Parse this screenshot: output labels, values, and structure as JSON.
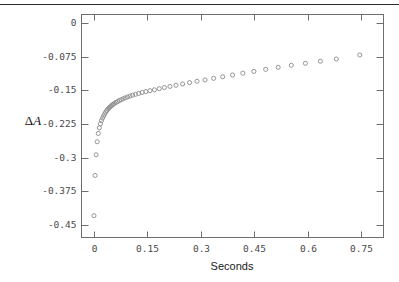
{
  "figure": {
    "top_rule": true,
    "background": "#ffffff",
    "frame_color": "#6e6e6e",
    "marker_color": "#8a8a8a",
    "text_color": "#4a4a4a"
  },
  "chart_data": {
    "type": "scatter",
    "title": "",
    "xlabel": "Seconds",
    "ylabel": "ΔA",
    "ylabel_parts": {
      "delta": "Δ",
      "variable": "A"
    },
    "xlim": [
      -0.035,
      0.812
    ],
    "ylim": [
      -0.4775,
      0.0185
    ],
    "xticks": [
      0,
      0.15,
      0.3,
      0.45,
      0.6,
      0.75
    ],
    "xticklabels": [
      "0",
      "0.15",
      "0.3",
      "0.45",
      "0.6",
      "0.75"
    ],
    "yticks": [
      0,
      -0.075,
      -0.15,
      -0.225,
      -0.3,
      -0.375,
      -0.45
    ],
    "yticklabels": [
      "0",
      "-0.075",
      "-0.15",
      "-0.225",
      "-0.3",
      "-0.375",
      "-0.45"
    ],
    "grid": false,
    "legend": null,
    "marker": "open-circle",
    "marker_size": 3.0,
    "series": [
      {
        "name": "delta-A-kinetics",
        "x": [
          0.0,
          0.003,
          0.006,
          0.009,
          0.012,
          0.015,
          0.018,
          0.021,
          0.024,
          0.027,
          0.03,
          0.033,
          0.036,
          0.039,
          0.042,
          0.045,
          0.048,
          0.051,
          0.0545,
          0.058,
          0.062,
          0.0665,
          0.071,
          0.076,
          0.0815,
          0.0875,
          0.094,
          0.101,
          0.1085,
          0.1165,
          0.1255,
          0.135,
          0.1455,
          0.157,
          0.1695,
          0.183,
          0.1975,
          0.213,
          0.23,
          0.2485,
          0.268,
          0.289,
          0.3115,
          0.3355,
          0.361,
          0.3885,
          0.4175,
          0.4485,
          0.4815,
          0.5165,
          0.5535,
          0.593,
          0.635,
          0.6795,
          0.7455
        ],
        "y": [
          -0.429,
          -0.3395,
          -0.2935,
          -0.2645,
          -0.246,
          -0.2335,
          -0.2245,
          -0.2175,
          -0.212,
          -0.207,
          -0.2025,
          -0.1985,
          -0.195,
          -0.192,
          -0.1895,
          -0.1872,
          -0.185,
          -0.183,
          -0.181,
          -0.179,
          -0.177,
          -0.175,
          -0.173,
          -0.171,
          -0.169,
          -0.167,
          -0.165,
          -0.163,
          -0.161,
          -0.159,
          -0.157,
          -0.155,
          -0.153,
          -0.151,
          -0.149,
          -0.1465,
          -0.144,
          -0.1415,
          -0.139,
          -0.136,
          -0.133,
          -0.13,
          -0.127,
          -0.1235,
          -0.12,
          -0.116,
          -0.112,
          -0.108,
          -0.1035,
          -0.099,
          -0.0945,
          -0.09,
          -0.0855,
          -0.0805,
          -0.0715
        ]
      }
    ]
  }
}
